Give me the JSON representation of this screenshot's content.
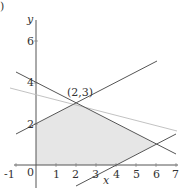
{
  "figure": {
    "panel_label": ")",
    "axes": {
      "x_label": "x",
      "y_label": "y",
      "x_ticks": [
        "-1",
        "0",
        "1",
        "2",
        "3",
        "4",
        "5",
        "6",
        "7"
      ],
      "y_ticks": [
        "2",
        "4",
        "6"
      ],
      "xlim": [
        -1,
        7
      ],
      "ylim": [
        -1,
        7
      ]
    },
    "point_label": "(2,3)",
    "lines": [
      {
        "name": "y = 4 - 0.5x",
        "color": "#555555"
      },
      {
        "name": "y = 2 + 0.5x",
        "color": "#555555"
      },
      {
        "name": "y = 0.5x - 2",
        "color": "#555555"
      },
      {
        "name": "objective level line",
        "color": "#bbbbbb"
      }
    ],
    "feasible_region": {
      "vertices": [
        [
          0,
          0
        ],
        [
          0,
          2
        ],
        [
          2,
          3
        ],
        [
          6,
          1
        ],
        [
          4,
          0
        ]
      ],
      "fill": "#e6e6e6"
    }
  }
}
